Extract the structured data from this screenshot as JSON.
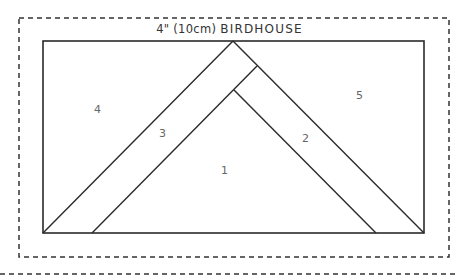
{
  "title": {
    "size_text": "4\" (10cm)",
    "name_text": "BIRDHOUSE"
  },
  "pieces": [
    {
      "id": "1",
      "label": "1",
      "x": 224,
      "y": 171
    },
    {
      "id": "2",
      "label": "2",
      "x": 306,
      "y": 139
    },
    {
      "id": "3",
      "label": "3",
      "x": 162,
      "y": 134
    },
    {
      "id": "4",
      "label": "4",
      "x": 98,
      "y": 110
    },
    {
      "id": "5",
      "label": "5",
      "x": 360,
      "y": 96
    }
  ],
  "colors": {
    "line": "#2a2a2a",
    "dash": "#333333",
    "label": "#666666"
  }
}
